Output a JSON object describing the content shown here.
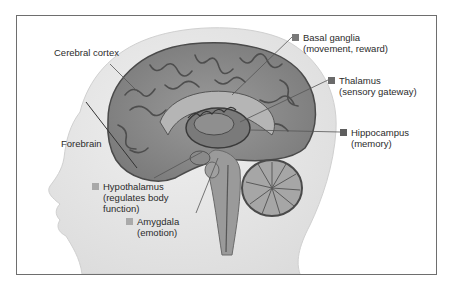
{
  "diagram": {
    "type": "anatomical sagittal section"
  },
  "colors": {
    "frame": "#6e6e6e",
    "marker_dark": "#6a6a6a",
    "marker_light": "#a8a8a8",
    "text": "#2b2b2b",
    "skin": "#e8e8e8",
    "brain": "#8c8c8c",
    "brain_dark": "#4a4a4a"
  },
  "labels": {
    "cerebral_cortex": {
      "title": "Cerebral cortex"
    },
    "forebrain": {
      "title": "Forebrain"
    },
    "basal_ganglia": {
      "title": "Basal ganglia",
      "desc": "(movement, reward)"
    },
    "thalamus": {
      "title": "Thalamus",
      "desc": "(sensory gateway)"
    },
    "hippocampus": {
      "title": "Hippocampus",
      "desc": "(memory)"
    },
    "hypothalamus": {
      "title": "Hypothalamus",
      "desc1": "(regulates body",
      "desc2": "function)"
    },
    "amygdala": {
      "title": "Amygdala",
      "desc": "(emotion)"
    }
  }
}
